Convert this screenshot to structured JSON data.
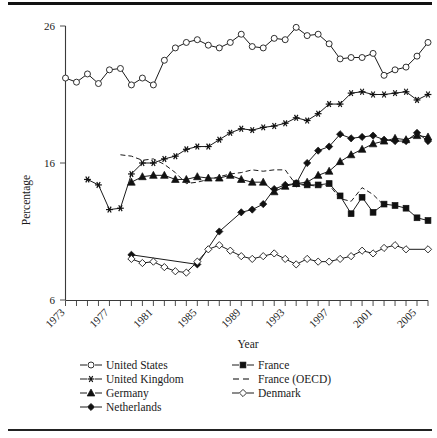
{
  "chart_data": {
    "type": "line",
    "title": "",
    "xlabel": "Year",
    "ylabel": "Percentage",
    "xlim": [
      1973,
      2006
    ],
    "ylim": [
      6,
      26
    ],
    "ytick_values": [
      6,
      16,
      26
    ],
    "ytick_labels": [
      "6",
      "16",
      "26"
    ],
    "xtick_values": [
      1973,
      1974,
      1975,
      1976,
      1977,
      1978,
      1979,
      1980,
      1981,
      1982,
      1983,
      1984,
      1985,
      1986,
      1987,
      1988,
      1989,
      1990,
      1991,
      1992,
      1993,
      1994,
      1995,
      1996,
      1997,
      1998,
      1999,
      2000,
      2001,
      2002,
      2003,
      2004,
      2005,
      2006
    ],
    "xtick_labels_shown": [
      "1973",
      "1977",
      "1981",
      "1985",
      "1989",
      "1993",
      "1997",
      "2001",
      "2005"
    ],
    "grid": false,
    "legend_position": "below",
    "series": [
      {
        "name": "United States",
        "marker": "open-circle",
        "linestyle": "solid",
        "x": [
          1973,
          1974,
          1975,
          1976,
          1977,
          1978,
          1979,
          1980,
          1981,
          1982,
          1983,
          1984,
          1985,
          1986,
          1987,
          1988,
          1989,
          1990,
          1991,
          1992,
          1993,
          1994,
          1995,
          1996,
          1997,
          1998,
          1999,
          2000,
          2001,
          2002,
          2003,
          2004,
          2005,
          2006
        ],
        "values": [
          22.2,
          21.9,
          22.5,
          21.8,
          22.8,
          22.9,
          21.7,
          22.2,
          21.7,
          23.5,
          24.4,
          24.8,
          25.0,
          24.6,
          24.4,
          24.8,
          25.4,
          24.5,
          24.4,
          25.1,
          25.0,
          25.9,
          25.3,
          25.4,
          24.7,
          23.6,
          23.7,
          23.7,
          24.0,
          22.4,
          22.8,
          23.0,
          23.8,
          24.8
        ]
      },
      {
        "name": "United Kingdom",
        "marker": "star",
        "linestyle": "solid",
        "x": [
          1975,
          1976,
          1977,
          1978,
          1979,
          1980,
          1981,
          1982,
          1983,
          1984,
          1985,
          1986,
          1987,
          1988,
          1989,
          1990,
          1991,
          1992,
          1993,
          1994,
          1995,
          1996,
          1997,
          1998,
          1999,
          2000,
          2001,
          2002,
          2003,
          2004,
          2005,
          2006
        ],
        "values": [
          14.8,
          14.4,
          12.6,
          12.7,
          15.2,
          16.0,
          16.0,
          16.3,
          16.5,
          17.0,
          17.2,
          17.2,
          17.7,
          18.2,
          18.5,
          18.4,
          18.6,
          18.7,
          18.9,
          19.3,
          19.1,
          19.6,
          20.3,
          20.3,
          21.1,
          21.2,
          21.0,
          21.0,
          21.1,
          21.2,
          20.6,
          21.0
        ]
      },
      {
        "name": "Germany",
        "marker": "solid-triangle",
        "linestyle": "solid",
        "x": [
          1979,
          1980,
          1981,
          1982,
          1983,
          1984,
          1985,
          1986,
          1987,
          1988,
          1989,
          1990,
          1991,
          1992,
          1993,
          1994,
          1995,
          1996,
          1997,
          1998,
          1999,
          2000,
          2001,
          2002,
          2003,
          2004,
          2005,
          2006
        ],
        "values": [
          14.6,
          15.0,
          15.1,
          15.1,
          14.8,
          14.8,
          15.0,
          14.9,
          14.9,
          15.1,
          14.8,
          14.6,
          14.6,
          13.9,
          14.3,
          14.5,
          14.6,
          15.1,
          15.4,
          16.1,
          16.6,
          17.0,
          17.4,
          17.6,
          17.8,
          17.7,
          18.0,
          17.9
        ]
      },
      {
        "name": "Netherlands",
        "marker": "solid-diamond",
        "linestyle": "solid",
        "x": [
          1979,
          1985,
          1987,
          1989,
          1990,
          1991,
          1992,
          1993,
          1994,
          1995,
          1996,
          1997,
          1998,
          1999,
          2000,
          2001,
          2002,
          2003,
          2004,
          2005,
          2006
        ],
        "values": [
          9.3,
          8.6,
          11.0,
          12.4,
          12.6,
          13.0,
          14.1,
          14.4,
          14.5,
          16.0,
          16.9,
          17.2,
          18.1,
          17.8,
          17.9,
          18.0,
          17.7,
          17.6,
          17.6,
          18.2,
          17.6
        ]
      },
      {
        "name": "France",
        "marker": "solid-square",
        "linestyle": "solid",
        "x": [
          1994,
          1995,
          1996,
          1997,
          1998,
          1999,
          2000,
          2001,
          2002,
          2003,
          2004,
          2005,
          2006
        ],
        "values": [
          14.5,
          14.4,
          14.4,
          14.5,
          13.6,
          12.3,
          13.5,
          12.4,
          13.0,
          12.9,
          12.7,
          12.0,
          11.8
        ]
      },
      {
        "name": "France (OECD)",
        "marker": "none",
        "linestyle": "dashed",
        "x": [
          1978,
          1979,
          1980,
          1981,
          1982,
          1983,
          1984,
          1985,
          1986,
          1987,
          1988,
          1989,
          1990,
          1991,
          1992,
          1993,
          1994,
          1995,
          1996,
          1997,
          1998,
          1999,
          2000,
          2001,
          2002
        ],
        "values": [
          16.6,
          16.5,
          16.2,
          16.3,
          15.9,
          15.3,
          14.5,
          14.6,
          14.8,
          15.0,
          15.2,
          15.3,
          15.5,
          15.4,
          15.5,
          15.5,
          14.4,
          14.4,
          14.3,
          14.4,
          13.4,
          13.2,
          14.2,
          13.7,
          12.9
        ]
      },
      {
        "name": "Denmark",
        "marker": "open-diamond",
        "linestyle": "solid",
        "x": [
          1979,
          1980,
          1981,
          1982,
          1983,
          1984,
          1985,
          1986,
          1987,
          1988,
          1989,
          1990,
          1991,
          1992,
          1993,
          1994,
          1995,
          1996,
          1997,
          1998,
          1999,
          2000,
          2001,
          2002,
          2003,
          2004,
          2006
        ],
        "values": [
          9.0,
          8.7,
          8.8,
          8.4,
          8.1,
          8.0,
          8.8,
          9.7,
          10.0,
          9.6,
          9.2,
          9.0,
          9.2,
          9.4,
          9.0,
          8.6,
          9.0,
          8.8,
          8.8,
          9.0,
          9.2,
          9.6,
          9.4,
          9.8,
          10.0,
          9.7,
          9.7
        ]
      }
    ]
  },
  "axes": {
    "ylabel": "Percentage",
    "xlabel": "Year",
    "ytick_labels": [
      "26",
      "16",
      "6"
    ],
    "xtick_labels": [
      "1973",
      "1977",
      "1981",
      "1985",
      "1989",
      "1993",
      "1997",
      "2001",
      "2005"
    ]
  },
  "legend": {
    "left_column": [
      {
        "label": "United States",
        "marker": "open-circle"
      },
      {
        "label": "United Kingdom",
        "marker": "star"
      },
      {
        "label": "Germany",
        "marker": "solid-triangle"
      },
      {
        "label": "Netherlands",
        "marker": "solid-diamond"
      }
    ],
    "right_column": [
      {
        "label": "France",
        "marker": "solid-square"
      },
      {
        "label": "France (OECD)",
        "marker": "dashed-line"
      },
      {
        "label": "Denmark",
        "marker": "open-diamond"
      }
    ]
  },
  "colors": {
    "ink": "#1a1a1a",
    "axis": "#3a3a3a",
    "background": "#ffffff"
  }
}
